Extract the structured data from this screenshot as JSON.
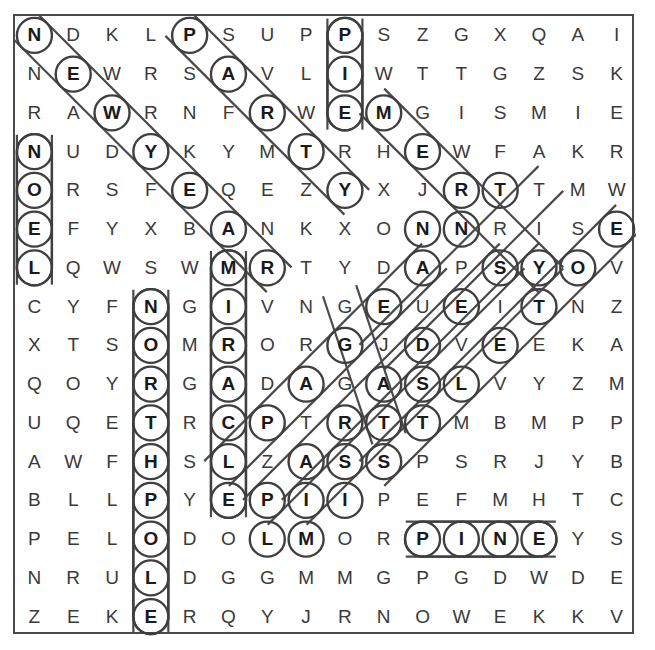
{
  "puzzle": {
    "type": "word-search",
    "title": "Christmas Word Search",
    "rows": 16,
    "cols": 16,
    "ink_color": "#3f3f3f",
    "letter_color": "#3a3a3a",
    "marked_letter_color": "#1a1a1a",
    "background_color": "#ffffff",
    "grid": [
      [
        "N",
        "D",
        "K",
        "L",
        "P",
        "S",
        "U",
        "P",
        "P",
        "S",
        "Z",
        "G",
        "X",
        "Q",
        "A",
        "I"
      ],
      [
        "N",
        "E",
        "W",
        "R",
        "S",
        "A",
        "V",
        "L",
        "I",
        "W",
        "T",
        "T",
        "G",
        "Z",
        "S",
        "K"
      ],
      [
        "R",
        "A",
        "W",
        "R",
        "N",
        "F",
        "R",
        "W",
        "E",
        "M",
        "G",
        "I",
        "S",
        "M",
        "I",
        "E"
      ],
      [
        "N",
        "U",
        "D",
        "Y",
        "K",
        "Y",
        "M",
        "T",
        "R",
        "H",
        "E",
        "W",
        "F",
        "A",
        "K",
        "R"
      ],
      [
        "O",
        "R",
        "S",
        "F",
        "E",
        "Q",
        "E",
        "Z",
        "Y",
        "X",
        "J",
        "R",
        "T",
        "T",
        "M",
        "W"
      ],
      [
        "E",
        "F",
        "Y",
        "X",
        "B",
        "A",
        "N",
        "K",
        "X",
        "O",
        "N",
        "N",
        "R",
        "I",
        "S",
        "E"
      ],
      [
        "L",
        "Q",
        "W",
        "S",
        "W",
        "M",
        "R",
        "T",
        "Y",
        "D",
        "A",
        "P",
        "S",
        "Y",
        "O",
        "V"
      ],
      [
        "C",
        "Y",
        "F",
        "N",
        "G",
        "I",
        "V",
        "N",
        "G",
        "E",
        "U",
        "E",
        "I",
        "T",
        "N",
        "Z"
      ],
      [
        "X",
        "T",
        "S",
        "O",
        "M",
        "R",
        "O",
        "R",
        "G",
        "J",
        "D",
        "V",
        "E",
        "E",
        "K",
        "A"
      ],
      [
        "Q",
        "O",
        "Y",
        "R",
        "G",
        "A",
        "D",
        "A",
        "G",
        "A",
        "S",
        "L",
        "V",
        "Y",
        "Z",
        "M"
      ],
      [
        "U",
        "Q",
        "E",
        "T",
        "R",
        "C",
        "P",
        "T",
        "R",
        "T",
        "T",
        "M",
        "B",
        "M",
        "P",
        "P"
      ],
      [
        "A",
        "W",
        "F",
        "H",
        "S",
        "L",
        "Z",
        "A",
        "S",
        "S",
        "P",
        "S",
        "R",
        "J",
        "Y",
        "B"
      ],
      [
        "B",
        "L",
        "L",
        "P",
        "Y",
        "E",
        "P",
        "I",
        "I",
        "P",
        "E",
        "F",
        "M",
        "H",
        "T",
        "C"
      ],
      [
        "P",
        "E",
        "L",
        "O",
        "D",
        "O",
        "L",
        "M",
        "O",
        "R",
        "P",
        "I",
        "N",
        "E",
        "Y",
        "S"
      ],
      [
        "N",
        "R",
        "U",
        "L",
        "D",
        "G",
        "G",
        "M",
        "M",
        "G",
        "P",
        "G",
        "D",
        "W",
        "D",
        "E"
      ],
      [
        "Z",
        "E",
        "K",
        "E",
        "R",
        "Q",
        "Y",
        "J",
        "R",
        "N",
        "O",
        "W",
        "E",
        "K",
        "K",
        "V"
      ]
    ],
    "found_words": [
      {
        "word": "NEWYEAR",
        "letters": [
          "N",
          "E",
          "W",
          "Y",
          "E",
          "A",
          "R"
        ],
        "start": [
          0,
          0
        ],
        "dir": "diagonal-down-right",
        "cells": [
          [
            0,
            0
          ],
          [
            1,
            1
          ],
          [
            2,
            2
          ],
          [
            3,
            3
          ],
          [
            4,
            4
          ],
          [
            5,
            5
          ],
          [
            6,
            6
          ]
        ]
      },
      {
        "word": "NOEL",
        "letters": [
          "N",
          "O",
          "E",
          "L"
        ],
        "start": [
          3,
          0
        ],
        "dir": "vertical-down",
        "cells": [
          [
            3,
            0
          ],
          [
            4,
            0
          ],
          [
            5,
            0
          ],
          [
            6,
            0
          ]
        ]
      },
      {
        "word": "PARTY",
        "letters": [
          "P",
          "A",
          "R",
          "T",
          "Y"
        ],
        "start": [
          0,
          4
        ],
        "dir": "diagonal-down-right",
        "cells": [
          [
            0,
            4
          ],
          [
            1,
            5
          ],
          [
            2,
            6
          ],
          [
            3,
            7
          ],
          [
            4,
            8
          ]
        ]
      },
      {
        "word": "PIE",
        "letters": [
          "P",
          "I",
          "E"
        ],
        "start": [
          0,
          8
        ],
        "dir": "vertical-down",
        "cells": [
          [
            0,
            8
          ],
          [
            1,
            8
          ],
          [
            2,
            8
          ]
        ]
      },
      {
        "word": "MERRY",
        "letters": [
          "M",
          "E",
          "R",
          "R",
          "Y"
        ],
        "start": [
          2,
          9
        ],
        "dir": "diagonal-down-right",
        "cells": [
          [
            2,
            9
          ],
          [
            3,
            10
          ],
          [
            4,
            11
          ],
          [
            5,
            12
          ],
          [
            6,
            13
          ]
        ]
      },
      {
        "word": "TRANSIT",
        "letters": [
          "T",
          "R",
          "N",
          "S",
          "T"
        ],
        "start": [
          4,
          13
        ],
        "dir": "diagonal-down-left",
        "cells": [
          [
            4,
            13
          ],
          [
            5,
            12
          ],
          [
            6,
            11
          ],
          [
            7,
            10
          ],
          [
            8,
            9
          ]
        ]
      },
      {
        "word": "MIRACLE",
        "letters": [
          "M",
          "I",
          "R",
          "A",
          "C",
          "L",
          "E"
        ],
        "start": [
          6,
          5
        ],
        "dir": "vertical-down",
        "cells": [
          [
            6,
            5
          ],
          [
            7,
            5
          ],
          [
            8,
            5
          ],
          [
            9,
            5
          ],
          [
            10,
            5
          ],
          [
            11,
            5
          ],
          [
            12,
            5
          ]
        ]
      },
      {
        "word": "NORTHPOLE",
        "letters": [
          "N",
          "O",
          "R",
          "T",
          "H",
          "P",
          "O",
          "L",
          "E"
        ],
        "start": [
          7,
          3
        ],
        "dir": "vertical-down",
        "cells": [
          [
            7,
            3
          ],
          [
            8,
            3
          ],
          [
            9,
            3
          ],
          [
            10,
            3
          ],
          [
            11,
            3
          ],
          [
            12,
            3
          ],
          [
            13,
            3
          ],
          [
            14,
            3
          ],
          [
            15,
            3
          ]
        ]
      },
      {
        "word": "PINE",
        "letters": [
          "P",
          "I",
          "N",
          "E"
        ],
        "start": [
          13,
          10
        ],
        "dir": "horizontal-right",
        "cells": [
          [
            13,
            10
          ],
          [
            13,
            11
          ],
          [
            13,
            12
          ],
          [
            13,
            13
          ]
        ]
      },
      {
        "word": "GRATITUDE",
        "letters": [
          "G",
          "A",
          "D",
          "S",
          "Y",
          "O",
          "E"
        ],
        "start": [
          5,
          15
        ],
        "dir": "diagonal-down-left",
        "cells": [
          [
            5,
            15
          ],
          [
            6,
            14
          ],
          [
            7,
            13
          ],
          [
            8,
            12
          ],
          [
            9,
            11
          ],
          [
            10,
            10
          ],
          [
            11,
            9
          ]
        ]
      },
      {
        "word": "ANGELS",
        "letters": [
          "A",
          "G",
          "A",
          "S",
          "S",
          "I"
        ],
        "start": [
          6,
          10
        ],
        "dir": "diagonal-down-right",
        "cells": [
          [
            6,
            10
          ],
          [
            7,
            9
          ],
          [
            8,
            8
          ],
          [
            9,
            7
          ],
          [
            10,
            6
          ],
          [
            11,
            5
          ]
        ]
      },
      {
        "word": "CAROLS",
        "letters": [
          "Y",
          "T",
          "E",
          "A",
          "T",
          "P",
          "M"
        ],
        "start": [
          6,
          13
        ],
        "dir": "diagonal-down-left",
        "cells": [
          [
            6,
            13
          ],
          [
            7,
            12
          ],
          [
            8,
            11
          ],
          [
            9,
            10
          ],
          [
            10,
            9
          ],
          [
            11,
            8
          ],
          [
            12,
            7
          ]
        ]
      },
      {
        "word": "STAR",
        "letters": [
          "S",
          "E",
          "A",
          "R",
          "S",
          "I",
          "L"
        ],
        "start": [
          6,
          12
        ],
        "dir": "diagonal-down-left",
        "cells": [
          [
            6,
            12
          ],
          [
            7,
            11
          ],
          [
            8,
            10
          ],
          [
            9,
            9
          ],
          [
            10,
            8
          ],
          [
            11,
            7
          ],
          [
            12,
            6
          ]
        ]
      },
      {
        "word": "GIFTS",
        "letters": [
          "G",
          "D",
          "L",
          "T"
        ],
        "start": [
          7,
          8
        ],
        "dir": "diagonal-down-right",
        "cells": [
          [
            7,
            8
          ],
          [
            8,
            10
          ],
          [
            9,
            11
          ],
          [
            10,
            9
          ]
        ]
      }
    ],
    "marked_cells": [
      [
        0,
        0
      ],
      [
        0,
        4
      ],
      [
        0,
        8
      ],
      [
        1,
        1
      ],
      [
        1,
        5
      ],
      [
        1,
        8
      ],
      [
        2,
        2
      ],
      [
        2,
        6
      ],
      [
        2,
        8
      ],
      [
        2,
        9
      ],
      [
        3,
        0
      ],
      [
        3,
        3
      ],
      [
        3,
        7
      ],
      [
        3,
        10
      ],
      [
        4,
        0
      ],
      [
        4,
        4
      ],
      [
        4,
        8
      ],
      [
        4,
        11
      ],
      [
        4,
        12
      ],
      [
        5,
        0
      ],
      [
        5,
        5
      ],
      [
        5,
        10
      ],
      [
        5,
        11
      ],
      [
        5,
        15
      ],
      [
        6,
        0
      ],
      [
        6,
        5
      ],
      [
        6,
        6
      ],
      [
        6,
        10
      ],
      [
        6,
        12
      ],
      [
        6,
        13
      ],
      [
        6,
        14
      ],
      [
        7,
        3
      ],
      [
        7,
        5
      ],
      [
        7,
        9
      ],
      [
        7,
        11
      ],
      [
        7,
        13
      ],
      [
        8,
        3
      ],
      [
        8,
        5
      ],
      [
        8,
        8
      ],
      [
        8,
        10
      ],
      [
        8,
        12
      ],
      [
        9,
        3
      ],
      [
        9,
        5
      ],
      [
        9,
        7
      ],
      [
        9,
        9
      ],
      [
        9,
        10
      ],
      [
        9,
        11
      ],
      [
        10,
        3
      ],
      [
        10,
        5
      ],
      [
        10,
        6
      ],
      [
        10,
        8
      ],
      [
        10,
        9
      ],
      [
        10,
        10
      ],
      [
        11,
        3
      ],
      [
        11,
        5
      ],
      [
        11,
        7
      ],
      [
        11,
        8
      ],
      [
        11,
        9
      ],
      [
        12,
        3
      ],
      [
        12,
        5
      ],
      [
        12,
        6
      ],
      [
        12,
        7
      ],
      [
        12,
        8
      ],
      [
        13,
        3
      ],
      [
        13,
        6
      ],
      [
        13,
        7
      ],
      [
        13,
        10
      ],
      [
        13,
        11
      ],
      [
        13,
        12
      ],
      [
        13,
        13
      ],
      [
        14,
        3
      ],
      [
        15,
        3
      ]
    ]
  }
}
